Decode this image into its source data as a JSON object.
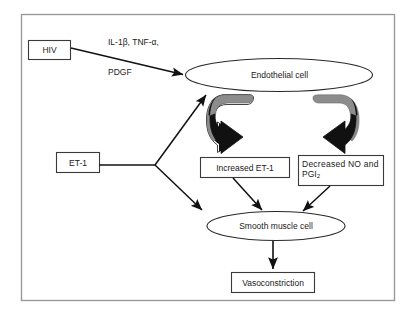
{
  "figure": {
    "frame_color": "#9a9a9a",
    "stroke_color": "#1a1a1a",
    "arrow_gray": "#8c8c8c",
    "arrow_black": "#111111",
    "background": "#ffffff"
  },
  "annotations": {
    "cytokines_line1": "IL-1β, TNF-α,",
    "cytokines_line2": "PDGF"
  },
  "nodes": {
    "hiv": {
      "label": "HIV",
      "shape": "box"
    },
    "endothelial_cell": {
      "label": "Endothelial cell",
      "shape": "ellipse"
    },
    "et1": {
      "label": "ET-1",
      "shape": "box"
    },
    "increased_et1": {
      "label": "Increased ET-1",
      "shape": "box"
    },
    "decreased_no": {
      "label_line1": "Decreased NO and",
      "label_line2_text": "PGI",
      "label_line2_sub": "2",
      "shape": "box"
    },
    "smooth_muscle_cell": {
      "label": "Smooth muscle cell",
      "shape": "ellipse"
    },
    "vasoconstriction": {
      "label": "Vasoconstriction",
      "shape": "box"
    }
  },
  "edges": [
    {
      "name": "hiv-to-endothelial",
      "from": "hiv",
      "to": "endothelial_cell",
      "style": "solid-arrow"
    },
    {
      "name": "et1-to-endothelial",
      "from": "et1",
      "to": "endothelial_cell",
      "style": "solid-arrow"
    },
    {
      "name": "et1-to-smooth-muscle",
      "from": "et1",
      "to": "smooth_muscle_cell",
      "style": "solid-arrow"
    },
    {
      "name": "endothelial-to-increased-et1",
      "from": "endothelial_cell",
      "to": "increased_et1",
      "style": "curved-block-arrow"
    },
    {
      "name": "endothelial-to-decreased-no",
      "from": "endothelial_cell",
      "to": "decreased_no",
      "style": "curved-block-arrow"
    },
    {
      "name": "increased-et1-to-smooth-muscle",
      "from": "increased_et1",
      "to": "smooth_muscle_cell",
      "style": "solid-arrow"
    },
    {
      "name": "decreased-no-to-smooth-muscle",
      "from": "decreased_no",
      "to": "smooth_muscle_cell",
      "style": "solid-arrow"
    },
    {
      "name": "smooth-muscle-to-vasoconstriction",
      "from": "smooth_muscle_cell",
      "to": "vasoconstriction",
      "style": "solid-arrow"
    }
  ]
}
